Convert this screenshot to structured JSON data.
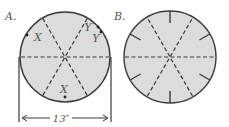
{
  "diagram": {
    "colors": {
      "fill": "#dcdcdc",
      "stroke": "#3a3a3a",
      "text": "#555555",
      "background": "#ffffff"
    },
    "panels": [
      {
        "label": "A.",
        "center": [
          65,
          57
        ],
        "radius": 45,
        "dashed_lines_deg": [
          0,
          60,
          120
        ],
        "markers": [
          {
            "text": "X",
            "label_pos": [
              38,
              41
            ],
            "dot": [
              27,
              35
            ]
          },
          {
            "text": "Y",
            "label_pos": [
              88,
              31
            ],
            "dot": [
              98,
              27
            ]
          },
          {
            "text": "Y",
            "label_pos": [
              96,
              42
            ],
            "dot": [
              101,
              32
            ]
          },
          {
            "text": "X",
            "label_pos": [
              64,
              93
            ],
            "dot": [
              65,
              97
            ]
          }
        ],
        "dimension": {
          "label": "13″",
          "y": 118,
          "x_left": 19,
          "x_right": 111
        }
      },
      {
        "label": "B.",
        "center": [
          170,
          57
        ],
        "radius": 46,
        "dashed_lines_deg": [
          0,
          60,
          120
        ],
        "tick_marks_deg": [
          30,
          90,
          150,
          210,
          270,
          330
        ],
        "tick_length": 12
      }
    ]
  }
}
